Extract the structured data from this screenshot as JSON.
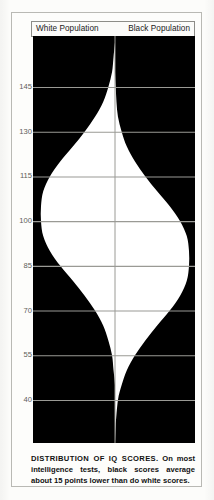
{
  "figure": {
    "header": {
      "left_label": "White Population",
      "right_label": "Black Population"
    },
    "caption": {
      "lead": "DISTRIBUTION OF IQ SCORES.",
      "body": " On most intelligence tests, black scores average about 15 points lower than do white scores."
    }
  },
  "colors": {
    "fill": "#000000",
    "curve_area": "#ffffff",
    "gridline": "#9a9a95",
    "frame": "#b9b9b4",
    "axis_text": "#5e5e5a",
    "page": "#fdfdfb"
  },
  "chart_data": {
    "type": "area",
    "title": "DISTRIBUTION OF IQ SCORES",
    "xlabel": "",
    "ylabel": "IQ score",
    "orientation": "horizontal-back-to-back",
    "grid": true,
    "legend_position": "top",
    "ylim": [
      32,
      160
    ],
    "y_ticks": [
      145,
      130,
      115,
      100,
      85,
      70,
      55,
      40
    ],
    "y_tick_labels": [
      "145",
      "130",
      "115",
      "100",
      "85",
      "70",
      "55",
      "40"
    ],
    "note": "Two mirrored normal distributions rendered as white silhouettes on a black field; white population centered at IQ 100, black population centered at IQ 85, both with standard deviation 15.",
    "series": [
      {
        "name": "White Population",
        "side": "left",
        "mean": 100,
        "std_dev": 15,
        "peak_iq": 100,
        "distribution": [
          {
            "iq": 160,
            "density": 0.0
          },
          {
            "iq": 155,
            "density": 0.02
          },
          {
            "iq": 150,
            "density": 0.04
          },
          {
            "iq": 145,
            "density": 0.09
          },
          {
            "iq": 140,
            "density": 0.16
          },
          {
            "iq": 135,
            "density": 0.27
          },
          {
            "iq": 130,
            "density": 0.41
          },
          {
            "iq": 125,
            "density": 0.57
          },
          {
            "iq": 120,
            "density": 0.74
          },
          {
            "iq": 115,
            "density": 0.88
          },
          {
            "iq": 110,
            "density": 0.97
          },
          {
            "iq": 105,
            "density": 1.0
          },
          {
            "iq": 100,
            "density": 1.0
          },
          {
            "iq": 95,
            "density": 0.97
          },
          {
            "iq": 90,
            "density": 0.88
          },
          {
            "iq": 85,
            "density": 0.74
          },
          {
            "iq": 80,
            "density": 0.57
          },
          {
            "iq": 75,
            "density": 0.41
          },
          {
            "iq": 70,
            "density": 0.27
          },
          {
            "iq": 65,
            "density": 0.16
          },
          {
            "iq": 60,
            "density": 0.09
          },
          {
            "iq": 55,
            "density": 0.04
          },
          {
            "iq": 50,
            "density": 0.02
          },
          {
            "iq": 45,
            "density": 0.0
          },
          {
            "iq": 40,
            "density": 0.0
          },
          {
            "iq": 32,
            "density": 0.0
          }
        ]
      },
      {
        "name": "Black Population",
        "side": "right",
        "mean": 85,
        "std_dev": 15,
        "peak_iq": 85,
        "distribution": [
          {
            "iq": 160,
            "density": 0.0
          },
          {
            "iq": 155,
            "density": 0.0
          },
          {
            "iq": 150,
            "density": 0.0
          },
          {
            "iq": 145,
            "density": 0.01
          },
          {
            "iq": 140,
            "density": 0.02
          },
          {
            "iq": 135,
            "density": 0.04
          },
          {
            "iq": 130,
            "density": 0.09
          },
          {
            "iq": 125,
            "density": 0.16
          },
          {
            "iq": 120,
            "density": 0.27
          },
          {
            "iq": 115,
            "density": 0.41
          },
          {
            "iq": 110,
            "density": 0.57
          },
          {
            "iq": 105,
            "density": 0.74
          },
          {
            "iq": 100,
            "density": 0.88
          },
          {
            "iq": 95,
            "density": 0.97
          },
          {
            "iq": 90,
            "density": 1.0
          },
          {
            "iq": 85,
            "density": 1.0
          },
          {
            "iq": 80,
            "density": 0.97
          },
          {
            "iq": 75,
            "density": 0.88
          },
          {
            "iq": 70,
            "density": 0.74
          },
          {
            "iq": 65,
            "density": 0.57
          },
          {
            "iq": 60,
            "density": 0.41
          },
          {
            "iq": 55,
            "density": 0.27
          },
          {
            "iq": 50,
            "density": 0.16
          },
          {
            "iq": 45,
            "density": 0.09
          },
          {
            "iq": 40,
            "density": 0.04
          },
          {
            "iq": 32,
            "density": 0.01
          }
        ]
      }
    ]
  }
}
